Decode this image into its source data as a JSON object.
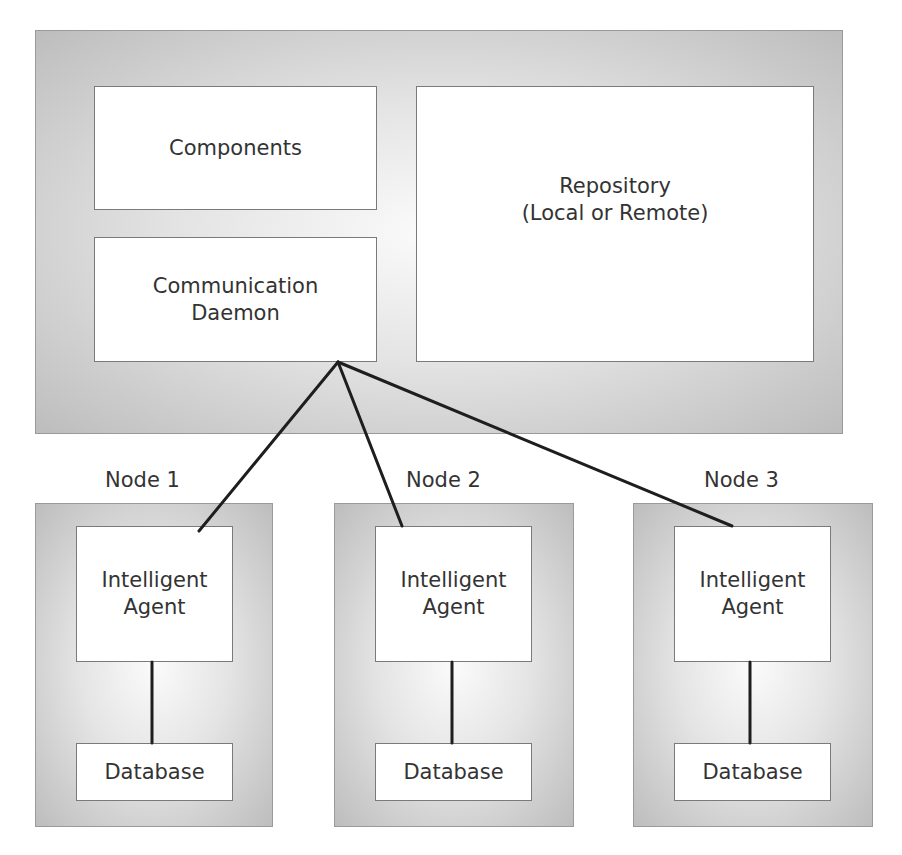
{
  "host": {
    "components_label": "Components",
    "daemon_label": "Communication\nDaemon",
    "repository_label": "Repository\n(Local or Remote)"
  },
  "nodes": [
    {
      "label": "Node 1",
      "agent_label": "Intelligent\nAgent",
      "database_label": "Database"
    },
    {
      "label": "Node 2",
      "agent_label": "Intelligent\nAgent",
      "database_label": "Database"
    },
    {
      "label": "Node 3",
      "agent_label": "Intelligent\nAgent",
      "database_label": "Database"
    }
  ],
  "connections": [
    {
      "from": "Communication Daemon",
      "to": "Node 1 Intelligent Agent"
    },
    {
      "from": "Communication Daemon",
      "to": "Node 2 Intelligent Agent"
    },
    {
      "from": "Communication Daemon",
      "to": "Node 3 Intelligent Agent"
    },
    {
      "from": "Node 1 Intelligent Agent",
      "to": "Node 1 Database"
    },
    {
      "from": "Node 2 Intelligent Agent",
      "to": "Node 2 Database"
    },
    {
      "from": "Node 3 Intelligent Agent",
      "to": "Node 3 Database"
    }
  ]
}
